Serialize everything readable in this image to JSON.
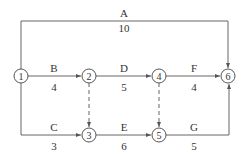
{
  "diagram": {
    "type": "activity-on-arrow network",
    "colors": {
      "line": "#555555",
      "text": "#333333",
      "background": "#ffffff"
    },
    "nodes": [
      {
        "id": "1",
        "label": "1",
        "x": 21,
        "y": 76
      },
      {
        "id": "2",
        "label": "2",
        "x": 89,
        "y": 76
      },
      {
        "id": "3",
        "label": "3",
        "x": 89,
        "y": 135
      },
      {
        "id": "4",
        "label": "4",
        "x": 159,
        "y": 76
      },
      {
        "id": "5",
        "label": "5",
        "x": 159,
        "y": 135
      },
      {
        "id": "6",
        "label": "6",
        "x": 228,
        "y": 76
      }
    ],
    "activities": [
      {
        "name": "A",
        "duration": "10",
        "from": "1",
        "to": "6"
      },
      {
        "name": "B",
        "duration": "4",
        "from": "1",
        "to": "2"
      },
      {
        "name": "C",
        "duration": "3",
        "from": "1",
        "to": "3"
      },
      {
        "name": "D",
        "duration": "5",
        "from": "2",
        "to": "4"
      },
      {
        "name": "E",
        "duration": "6",
        "from": "3",
        "to": "5"
      },
      {
        "name": "F",
        "duration": "4",
        "from": "4",
        "to": "6"
      },
      {
        "name": "G",
        "duration": "5",
        "from": "5",
        "to": "6"
      }
    ],
    "dummies": [
      {
        "from": "2",
        "to": "3"
      },
      {
        "from": "4",
        "to": "5"
      }
    ]
  }
}
